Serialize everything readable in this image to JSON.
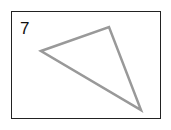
{
  "figure": {
    "label": "7",
    "shape": "triangle",
    "vertices": [
      [
        41,
        51
      ],
      [
        109,
        27
      ],
      [
        141,
        110
      ]
    ],
    "stroke_color": "#999999",
    "border_color": "#222222"
  }
}
